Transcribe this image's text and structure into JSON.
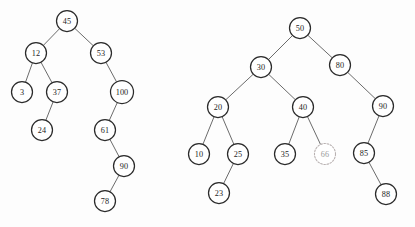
{
  "figure": {
    "background_color": "#fdfdfd",
    "node_fill": "#ffffff",
    "node_stroke": "#2b2b2b",
    "ghost_node_stroke": "#b9b2b2",
    "edge_color": "#5a5a5a",
    "label_color": "#242424",
    "ghost_label_color": "#9b9b9b"
  },
  "trees": [
    {
      "name": "left-tree",
      "root_value": "45",
      "nodes": [
        {
          "id": "l45",
          "label": "45",
          "cx": 67,
          "cy": 21,
          "r": 10.5,
          "style": "solid"
        },
        {
          "id": "l12",
          "label": "12",
          "cx": 36,
          "cy": 53,
          "r": 10.5,
          "style": "solid"
        },
        {
          "id": "l53",
          "label": "53",
          "cx": 101,
          "cy": 53,
          "r": 10.5,
          "style": "solid"
        },
        {
          "id": "l3",
          "label": "3",
          "cx": 22,
          "cy": 92,
          "r": 10.5,
          "style": "solid"
        },
        {
          "id": "l37",
          "label": "37",
          "cx": 57,
          "cy": 92,
          "r": 10.5,
          "style": "solid"
        },
        {
          "id": "l100",
          "label": "100",
          "cx": 122,
          "cy": 92,
          "r": 11.5,
          "style": "solid"
        },
        {
          "id": "l24",
          "label": "24",
          "cx": 42,
          "cy": 130,
          "r": 10.5,
          "style": "solid"
        },
        {
          "id": "l61",
          "label": "61",
          "cx": 105,
          "cy": 130,
          "r": 10.5,
          "style": "solid"
        },
        {
          "id": "l90",
          "label": "90",
          "cx": 124,
          "cy": 166,
          "r": 10.5,
          "style": "solid"
        },
        {
          "id": "l78",
          "label": "78",
          "cx": 105,
          "cy": 201,
          "r": 10.5,
          "style": "solid"
        }
      ],
      "edges": [
        {
          "from": "l45",
          "to": "l12"
        },
        {
          "from": "l45",
          "to": "l53"
        },
        {
          "from": "l12",
          "to": "l3"
        },
        {
          "from": "l12",
          "to": "l37"
        },
        {
          "from": "l53",
          "to": "l100"
        },
        {
          "from": "l37",
          "to": "l24"
        },
        {
          "from": "l100",
          "to": "l61"
        },
        {
          "from": "l61",
          "to": "l90"
        },
        {
          "from": "l90",
          "to": "l78"
        }
      ]
    },
    {
      "name": "right-tree",
      "root_value": "50",
      "nodes": [
        {
          "id": "r50",
          "label": "50",
          "cx": 300,
          "cy": 28,
          "r": 10.5,
          "style": "solid"
        },
        {
          "id": "r30",
          "label": "30",
          "cx": 261,
          "cy": 67,
          "r": 10.5,
          "style": "solid"
        },
        {
          "id": "r80",
          "label": "80",
          "cx": 340,
          "cy": 65,
          "r": 10.5,
          "style": "solid"
        },
        {
          "id": "r20",
          "label": "20",
          "cx": 218,
          "cy": 107,
          "r": 10.5,
          "style": "solid"
        },
        {
          "id": "r40",
          "label": "40",
          "cx": 303,
          "cy": 107,
          "r": 10.5,
          "style": "solid"
        },
        {
          "id": "r90",
          "label": "90",
          "cx": 383,
          "cy": 106,
          "r": 10.5,
          "style": "solid"
        },
        {
          "id": "r10",
          "label": "10",
          "cx": 199,
          "cy": 154,
          "r": 10.5,
          "style": "solid"
        },
        {
          "id": "r25",
          "label": "25",
          "cx": 238,
          "cy": 154,
          "r": 10.5,
          "style": "solid"
        },
        {
          "id": "r35",
          "label": "35",
          "cx": 285,
          "cy": 154,
          "r": 10.5,
          "style": "solid"
        },
        {
          "id": "r66",
          "label": "66",
          "cx": 325,
          "cy": 154,
          "r": 10.5,
          "style": "dotted"
        },
        {
          "id": "r85",
          "label": "85",
          "cx": 364,
          "cy": 153,
          "r": 10.5,
          "style": "solid"
        },
        {
          "id": "r23",
          "label": "23",
          "cx": 219,
          "cy": 193,
          "r": 10.5,
          "style": "solid"
        },
        {
          "id": "r88",
          "label": "88",
          "cx": 386,
          "cy": 194,
          "r": 10.5,
          "style": "solid"
        }
      ],
      "edges": [
        {
          "from": "r50",
          "to": "r30"
        },
        {
          "from": "r50",
          "to": "r80"
        },
        {
          "from": "r30",
          "to": "r20"
        },
        {
          "from": "r30",
          "to": "r40"
        },
        {
          "from": "r80",
          "to": "r90"
        },
        {
          "from": "r20",
          "to": "r10"
        },
        {
          "from": "r20",
          "to": "r25"
        },
        {
          "from": "r40",
          "to": "r35"
        },
        {
          "from": "r40",
          "to": "r66"
        },
        {
          "from": "r90",
          "to": "r85"
        },
        {
          "from": "r25",
          "to": "r23"
        },
        {
          "from": "r85",
          "to": "r88"
        }
      ]
    }
  ]
}
